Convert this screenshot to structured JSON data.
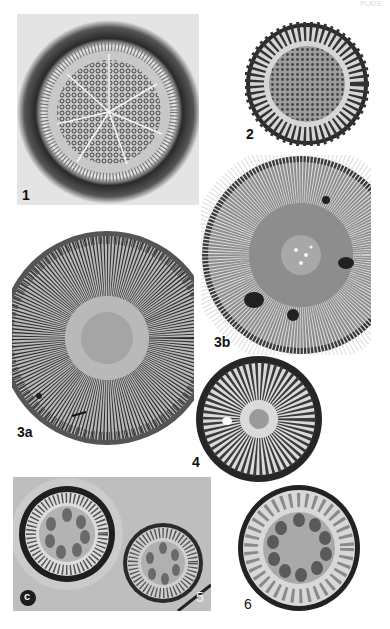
{
  "plate": {
    "header_text": "PLATE",
    "background": "#ffffff",
    "panels": [
      {
        "id": "1",
        "label": "1",
        "type": "square-frame",
        "shape": "centric diatom, areolate center with radial rows, dark halo"
      },
      {
        "id": "2",
        "label": "2",
        "type": "circle",
        "shape": "centric diatom, granular center, coarse marginal striae"
      },
      {
        "id": "3b",
        "label": "3b",
        "type": "circle",
        "shape": "centric diatom, fine radial striae, small central area with dark spots"
      },
      {
        "id": "3a",
        "label": "3a",
        "type": "circle-cropped-left",
        "shape": "centric diatom, dense radial striae, central area"
      },
      {
        "id": "4",
        "label": "4",
        "type": "circle",
        "shape": "centric diatom, radiating striae, dark rim"
      },
      {
        "id": "5",
        "label": "5",
        "type": "rect-frame",
        "shape": "two valves with rosette of central chambers in grey field",
        "inset_label": "c"
      },
      {
        "id": "6",
        "label": "6",
        "type": "circle",
        "shape": "centric diatom with ring of ~11 central chambers, marginal costae"
      }
    ]
  },
  "colors": {
    "dark": "#1e1e1e",
    "mid": "#7a7a7a",
    "light": "#d9d9d9",
    "field": "#bdbdbd"
  }
}
